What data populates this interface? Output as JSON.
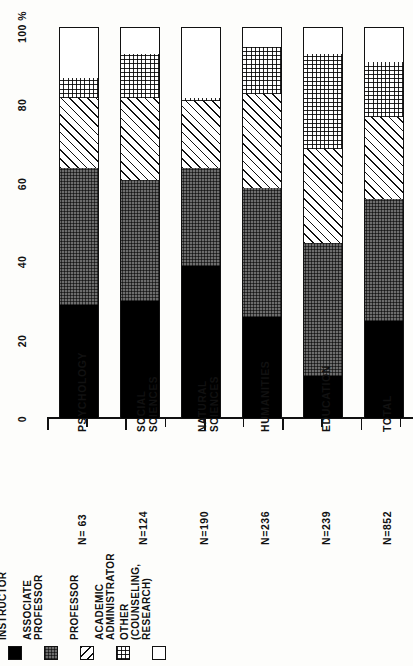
{
  "chart_data": {
    "type": "bar",
    "orientation": "stacked-vertical-rotated",
    "title": "",
    "xlabel": "",
    "ylabel": "",
    "axis_unit": "100%",
    "ylim": [
      0,
      100
    ],
    "yticks": [
      0,
      20,
      40,
      60,
      80,
      100
    ],
    "ytick_labels": [
      "0",
      "20",
      "40",
      "60",
      "80",
      "100"
    ],
    "minor_ticks": [
      10,
      30,
      50,
      70,
      90
    ],
    "grid": false,
    "legend_position": "bottom-left",
    "categories": [
      "PSYCHOLOGY",
      "SOCIAL SCIENCES",
      "NATURAL SCIENCES",
      "HUMANITIES",
      "EDUCATION",
      "TOTAL"
    ],
    "category_counts": [
      "N= 63",
      "N=124",
      "N=190",
      "N=236",
      "N=239",
      "N=852"
    ],
    "series": [
      {
        "name": "ASSISTANT PROFESSOR/INSTRUCTOR",
        "fill": "solid-black",
        "values": [
          29,
          30,
          39,
          26,
          11,
          25
        ]
      },
      {
        "name": "ASSOCIATE PROFESSOR",
        "fill": "gray-grid",
        "values": [
          35,
          31,
          25,
          33,
          34,
          31
        ]
      },
      {
        "name": "PROFESSOR",
        "fill": "diagonal-hatch",
        "values": [
          18,
          21,
          17,
          24,
          24,
          21
        ]
      },
      {
        "name": "ACADEMIC ADMINISTRATOR",
        "fill": "fine-dot",
        "values": [
          5,
          11,
          1,
          12,
          24,
          14
        ]
      },
      {
        "name": "OTHER (COUNSELING, RESEARCH)",
        "fill": "white",
        "values": [
          13,
          7,
          18,
          5,
          7,
          9
        ]
      }
    ]
  },
  "legend": {
    "items": [
      {
        "key": "assistant",
        "fill": "solid-black",
        "lines": [
          "ASSISTANT",
          "PROFESSOR/",
          "INSTRUCTOR"
        ]
      },
      {
        "key": "associate",
        "fill": "gray-grid",
        "lines": [
          "ASSOCIATE",
          "PROFESSOR"
        ]
      },
      {
        "key": "professor",
        "fill": "diagonal-hatch",
        "lines": [
          "PROFESSOR"
        ]
      },
      {
        "key": "admin",
        "fill": "fine-dot",
        "lines": [
          "ACADEMIC",
          "ADMINISTRATOR"
        ]
      },
      {
        "key": "other",
        "fill": "white",
        "lines": [
          "OTHER",
          "(COUNSELING,",
          "RESEARCH)"
        ]
      }
    ]
  },
  "colors": {
    "ink": "#111111",
    "paper": "#fdfdfb",
    "assistant": "#000000",
    "associate": "#6d6d6d",
    "professor": "#ffffff",
    "admin": "#ffffff",
    "other": "#ffffff"
  }
}
